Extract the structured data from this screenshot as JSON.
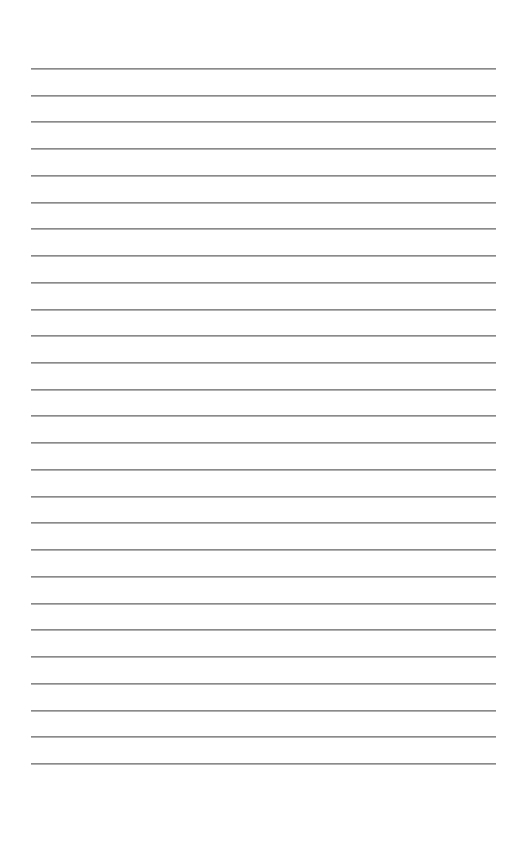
{
  "page": {
    "type": "lined-paper",
    "background_color": "#ffffff",
    "rule_color": "#8a8a8a",
    "rule_count": 27,
    "first_rule_y": 68,
    "rule_spacing": 26.73,
    "rule_left": 31,
    "rule_right": 496
  }
}
